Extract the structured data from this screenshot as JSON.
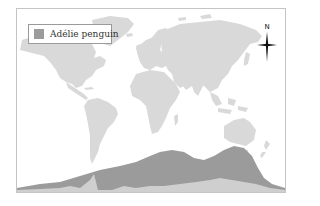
{
  "map": {
    "title": "Adélie penguin range map",
    "legend": {
      "items": [
        {
          "label": "Adélie penguin",
          "swatch_color": "#9b9b9b"
        }
      ]
    },
    "compass": {
      "label": "N"
    },
    "colors": {
      "background": "#ffffff",
      "land": "#d9d9d9",
      "antarctica": "#cfcfcf",
      "range": "#9b9b9b",
      "frame_border": "#c4c4c4"
    }
  }
}
